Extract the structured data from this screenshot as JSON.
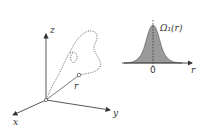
{
  "left_diagram": {
    "axes": {
      "x_label": "x",
      "y_label": "y",
      "z_label": "z"
    },
    "position_label": "r",
    "description": "3D coordinate axes with a dotted random-walk path from origin to point r, with vector r"
  },
  "right_diagram": {
    "function_label": "Ω₁(r)",
    "origin_label": "0",
    "axis_label": "r",
    "fill_color": "#9a9a9a",
    "description": "Gaussian-shaped distribution centered at 0"
  }
}
